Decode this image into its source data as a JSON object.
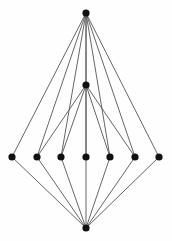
{
  "figure": {
    "width": 172,
    "height": 241,
    "background_color": "#fefefe"
  },
  "style": {
    "node_color": "#111111",
    "node_radius": 3.6,
    "edge_color": "#555555",
    "edge_width": 0.9
  },
  "chart_data": {
    "type": "scatter",
    "title": "",
    "xlabel": "",
    "ylabel": "",
    "grid": false,
    "legend": null,
    "xlim": [
      0,
      172
    ],
    "ylim": [
      0,
      241
    ],
    "nodes": [
      {
        "id": "top",
        "label": "",
        "x": 86,
        "y": 13,
        "role": "top-apex"
      },
      {
        "id": "mid",
        "label": "",
        "x": 86,
        "y": 85,
        "role": "mid-apex"
      },
      {
        "id": "r1",
        "label": "",
        "x": 12,
        "y": 157,
        "role": "row"
      },
      {
        "id": "r2",
        "label": "",
        "x": 37,
        "y": 157,
        "role": "row"
      },
      {
        "id": "r3",
        "label": "",
        "x": 61,
        "y": 157,
        "role": "row"
      },
      {
        "id": "r4",
        "label": "",
        "x": 86,
        "y": 157,
        "role": "row"
      },
      {
        "id": "r5",
        "label": "",
        "x": 110,
        "y": 157,
        "role": "row"
      },
      {
        "id": "r6",
        "label": "",
        "x": 135,
        "y": 157,
        "role": "row"
      },
      {
        "id": "r7",
        "label": "",
        "x": 159,
        "y": 157,
        "role": "row"
      },
      {
        "id": "bot",
        "label": "",
        "x": 86,
        "y": 228,
        "role": "bottom-apex"
      }
    ],
    "edges": [
      {
        "source": "top",
        "target": "r1"
      },
      {
        "source": "top",
        "target": "r2"
      },
      {
        "source": "top",
        "target": "r3"
      },
      {
        "source": "top",
        "target": "r4"
      },
      {
        "source": "top",
        "target": "r5"
      },
      {
        "source": "top",
        "target": "r6"
      },
      {
        "source": "top",
        "target": "r7"
      },
      {
        "source": "top",
        "target": "mid"
      },
      {
        "source": "mid",
        "target": "r2"
      },
      {
        "source": "mid",
        "target": "r3"
      },
      {
        "source": "mid",
        "target": "r4"
      },
      {
        "source": "mid",
        "target": "r5"
      },
      {
        "source": "mid",
        "target": "r6"
      },
      {
        "source": "bot",
        "target": "r1"
      },
      {
        "source": "bot",
        "target": "r2"
      },
      {
        "source": "bot",
        "target": "r3"
      },
      {
        "source": "bot",
        "target": "r4"
      },
      {
        "source": "bot",
        "target": "r5"
      },
      {
        "source": "bot",
        "target": "r6"
      },
      {
        "source": "bot",
        "target": "r7"
      }
    ],
    "counts": {
      "node_count": 10,
      "edge_count": 20,
      "row_node_count": 7
    }
  }
}
